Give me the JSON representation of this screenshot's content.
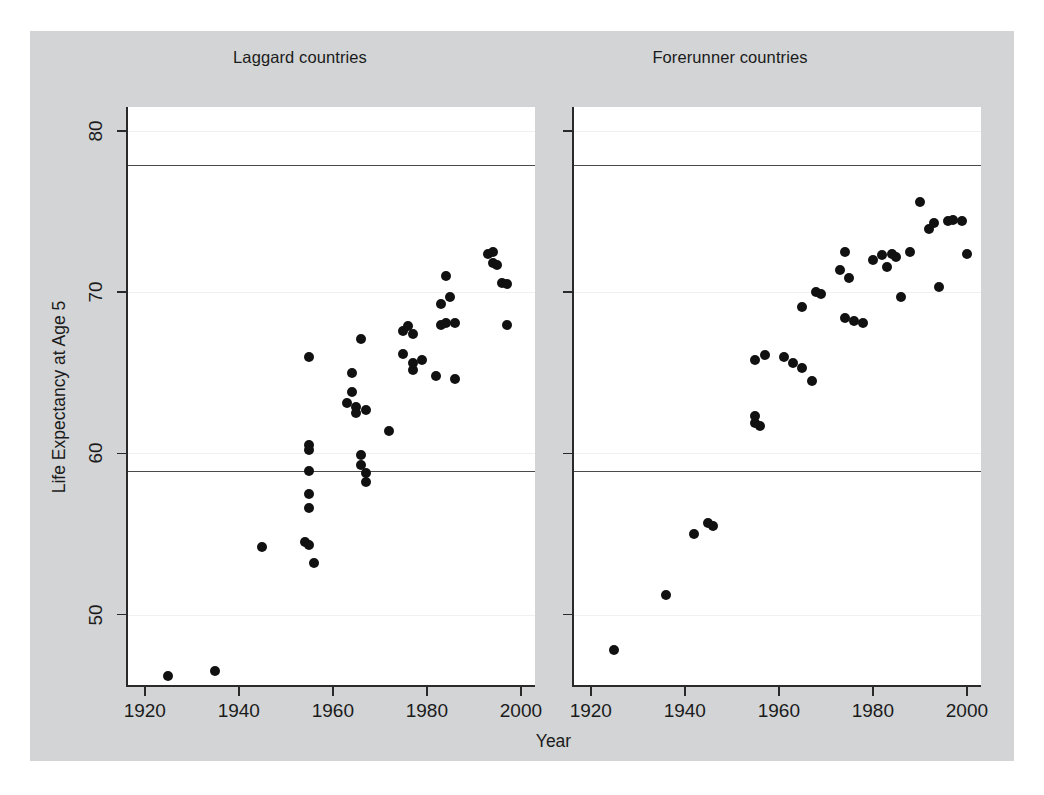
{
  "figure": {
    "background_color": "#d2d4d6",
    "panel_background_color": "#ffffff",
    "marker_color": "#111111",
    "axis_color": "#2a2a2a",
    "reference_line_color": "#4a4a4a"
  },
  "axis": {
    "xlabel": "Year",
    "ylabel": "Life Expectancy at Age 5",
    "xticks": [
      "1920",
      "1940",
      "1960",
      "1980",
      "2000"
    ],
    "yticks": [
      "50",
      "60",
      "70",
      "80"
    ]
  },
  "panels": [
    {
      "title": "Laggard countries"
    },
    {
      "title": "Forerunner countries"
    }
  ],
  "chart_data": {
    "type": "scatter",
    "title": "",
    "xlabel": "Year",
    "ylabel": "Life Expectancy at Age 5",
    "xlim": [
      1916,
      2003
    ],
    "ylim": [
      45.5,
      81.5
    ],
    "xticks": [
      1920,
      1940,
      1960,
      1980,
      2000
    ],
    "yticks": [
      50,
      60,
      70,
      80
    ],
    "grid": true,
    "legend": "none",
    "reference_lines": {
      "laggard": [
        58.9,
        77.9
      ],
      "forerunner": [
        58.9,
        77.9
      ]
    },
    "panels": [
      {
        "name": "Laggard countries",
        "marker": "filled-circle",
        "points": [
          {
            "x": 1925,
            "y": 46.2
          },
          {
            "x": 1935,
            "y": 46.5
          },
          {
            "x": 1945,
            "y": 54.2
          },
          {
            "x": 1954,
            "y": 54.5
          },
          {
            "x": 1955,
            "y": 54.3
          },
          {
            "x": 1955,
            "y": 56.6
          },
          {
            "x": 1955,
            "y": 57.5
          },
          {
            "x": 1955,
            "y": 58.9
          },
          {
            "x": 1955,
            "y": 60.2
          },
          {
            "x": 1955,
            "y": 60.5
          },
          {
            "x": 1955,
            "y": 66.0
          },
          {
            "x": 1956,
            "y": 53.2
          },
          {
            "x": 1963,
            "y": 63.1
          },
          {
            "x": 1964,
            "y": 63.8
          },
          {
            "x": 1964,
            "y": 65.0
          },
          {
            "x": 1965,
            "y": 62.9
          },
          {
            "x": 1965,
            "y": 62.5
          },
          {
            "x": 1966,
            "y": 59.9
          },
          {
            "x": 1966,
            "y": 59.3
          },
          {
            "x": 1966,
            "y": 67.1
          },
          {
            "x": 1967,
            "y": 58.8
          },
          {
            "x": 1967,
            "y": 58.2
          },
          {
            "x": 1967,
            "y": 62.7
          },
          {
            "x": 1972,
            "y": 61.4
          },
          {
            "x": 1975,
            "y": 66.2
          },
          {
            "x": 1975,
            "y": 67.6
          },
          {
            "x": 1976,
            "y": 67.9
          },
          {
            "x": 1977,
            "y": 65.2
          },
          {
            "x": 1977,
            "y": 65.6
          },
          {
            "x": 1977,
            "y": 67.4
          },
          {
            "x": 1979,
            "y": 65.8
          },
          {
            "x": 1982,
            "y": 64.8
          },
          {
            "x": 1983,
            "y": 69.3
          },
          {
            "x": 1983,
            "y": 68.0
          },
          {
            "x": 1984,
            "y": 71.0
          },
          {
            "x": 1984,
            "y": 68.1
          },
          {
            "x": 1985,
            "y": 69.7
          },
          {
            "x": 1986,
            "y": 68.1
          },
          {
            "x": 1986,
            "y": 64.6
          },
          {
            "x": 1993,
            "y": 72.4
          },
          {
            "x": 1994,
            "y": 72.5
          },
          {
            "x": 1994,
            "y": 71.8
          },
          {
            "x": 1995,
            "y": 71.7
          },
          {
            "x": 1996,
            "y": 70.6
          },
          {
            "x": 1997,
            "y": 70.5
          },
          {
            "x": 1997,
            "y": 68.0
          }
        ]
      },
      {
        "name": "Forerunner countries",
        "marker": "filled-circle",
        "points": [
          {
            "x": 1925,
            "y": 47.8
          },
          {
            "x": 1936,
            "y": 51.2
          },
          {
            "x": 1942,
            "y": 55.0
          },
          {
            "x": 1945,
            "y": 55.7
          },
          {
            "x": 1946,
            "y": 55.5
          },
          {
            "x": 1955,
            "y": 62.3
          },
          {
            "x": 1955,
            "y": 61.9
          },
          {
            "x": 1955,
            "y": 65.8
          },
          {
            "x": 1956,
            "y": 61.7
          },
          {
            "x": 1957,
            "y": 66.1
          },
          {
            "x": 1961,
            "y": 66.0
          },
          {
            "x": 1963,
            "y": 65.6
          },
          {
            "x": 1965,
            "y": 65.3
          },
          {
            "x": 1965,
            "y": 69.1
          },
          {
            "x": 1967,
            "y": 64.5
          },
          {
            "x": 1968,
            "y": 70.0
          },
          {
            "x": 1969,
            "y": 69.9
          },
          {
            "x": 1973,
            "y": 71.4
          },
          {
            "x": 1974,
            "y": 68.4
          },
          {
            "x": 1974,
            "y": 72.5
          },
          {
            "x": 1975,
            "y": 70.9
          },
          {
            "x": 1976,
            "y": 68.2
          },
          {
            "x": 1978,
            "y": 68.1
          },
          {
            "x": 1980,
            "y": 72.0
          },
          {
            "x": 1982,
            "y": 72.3
          },
          {
            "x": 1983,
            "y": 71.6
          },
          {
            "x": 1984,
            "y": 72.4
          },
          {
            "x": 1985,
            "y": 72.2
          },
          {
            "x": 1986,
            "y": 69.7
          },
          {
            "x": 1988,
            "y": 72.5
          },
          {
            "x": 1990,
            "y": 75.6
          },
          {
            "x": 1992,
            "y": 73.9
          },
          {
            "x": 1993,
            "y": 74.3
          },
          {
            "x": 1994,
            "y": 70.3
          },
          {
            "x": 1996,
            "y": 74.4
          },
          {
            "x": 1997,
            "y": 74.5
          },
          {
            "x": 1999,
            "y": 74.4
          },
          {
            "x": 2000,
            "y": 72.4
          }
        ]
      }
    ]
  }
}
